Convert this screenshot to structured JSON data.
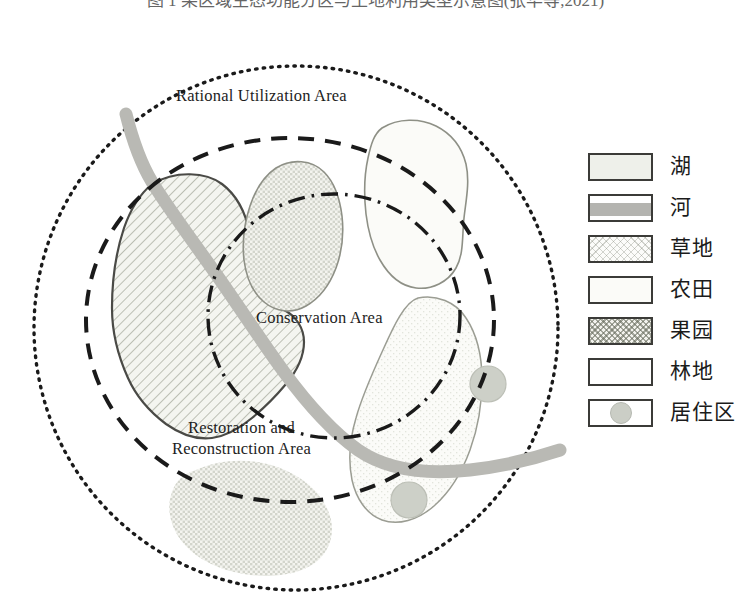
{
  "caption": {
    "text": "图 1  某区域生态功能分区与土地利用类型示意图(张华等,2021)"
  },
  "map": {
    "zones": [
      {
        "id": "rational",
        "label": "Rational Utilization Area",
        "line_style": "dotted",
        "color": "#171717"
      },
      {
        "id": "restoration",
        "label": "Restoration and\nReconstruction Area",
        "line_style": "dashed",
        "color": "#171717"
      },
      {
        "id": "conservation",
        "label": "Conservation Area",
        "line_style": "dash-dot",
        "color": "#171717"
      }
    ],
    "zone_labels": {
      "rational": "Rational Utilization Area",
      "conservation": "Conservation Area",
      "restoration_line1": "Restoration and",
      "restoration_line2": "Reconstruction Area"
    },
    "features": [
      {
        "name": "lake-hatched-west",
        "type": "湖",
        "fill": "#f0f1ec"
      },
      {
        "name": "orchard-center",
        "type": "果园",
        "fill": "#f1f1ec"
      },
      {
        "name": "farmland-northeast",
        "type": "农田",
        "fill": "#fbfbf8"
      },
      {
        "name": "woodland-east",
        "type": "林地",
        "fill": "#fdfdfb"
      },
      {
        "name": "grassland-southeast",
        "type": "草地",
        "fill": "#fafaf6"
      },
      {
        "name": "orchard-south",
        "type": "果园",
        "fill": "#f1f1ec"
      },
      {
        "name": "river-main",
        "type": "河",
        "fill": "#b8b8b3"
      },
      {
        "name": "residential-north",
        "type": "居住区",
        "fill": "#cdd0c8"
      },
      {
        "name": "residential-south",
        "type": "居住区",
        "fill": "#cdd0c8"
      }
    ]
  },
  "legend": {
    "items": [
      {
        "key": "lake",
        "label": "湖",
        "swatch": "sw-lake",
        "color": "#eef0ea"
      },
      {
        "key": "river",
        "label": "河",
        "swatch": "sw-river",
        "color": "#b4b4b0"
      },
      {
        "key": "grassland",
        "label": "草地",
        "swatch": "sw-grass",
        "color": "#fcfcfa"
      },
      {
        "key": "farmland",
        "label": "农田",
        "swatch": "sw-farm",
        "color": "#fbfbf8"
      },
      {
        "key": "orchard",
        "label": "果园",
        "swatch": "sw-orchard",
        "color": "#f3f3ee"
      },
      {
        "key": "woodland",
        "label": "林地",
        "swatch": "sw-wood",
        "color": "#ffffff"
      },
      {
        "key": "residential",
        "label": "居住区",
        "swatch": "sw-resid",
        "color": "#cbcec6"
      }
    ]
  }
}
